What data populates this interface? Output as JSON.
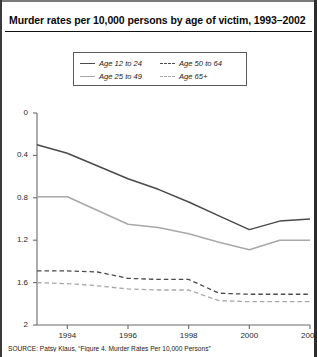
{
  "title": "Murder rates per 10,000 persons by age of victim, 1993–2002",
  "source": "SOURCE: Patsy Klaus, “Figure 4. Murder Rates Per 10,000 Persons”",
  "legend": {
    "position": "top-center",
    "entries": [
      {
        "label": "Age 12 to 24",
        "style": "solid",
        "color": "#4a4a4a"
      },
      {
        "label": "Age 50 to 64",
        "style": "dashed",
        "color": "#4a4a4a"
      },
      {
        "label": "Age 25 to 49",
        "style": "solid",
        "color": "#a8a8a8"
      },
      {
        "label": "Age 65+",
        "style": "dashed",
        "color": "#a8a8a8"
      }
    ]
  },
  "axes": {
    "y_ticks": [
      "2",
      "1.6",
      "1.2",
      "0.8",
      "0.4",
      "0"
    ],
    "x_ticks": [
      "1994",
      "1996",
      "1998",
      "2000",
      "2002"
    ]
  },
  "chart_data": {
    "type": "line",
    "title": "Murder rates per 10,000 persons by age of victim, 1993–2002",
    "xlabel": "",
    "ylabel": "",
    "x": [
      1993,
      1994,
      1995,
      1996,
      1997,
      1998,
      1999,
      2000,
      2001,
      2002
    ],
    "xlim": [
      1993,
      2002
    ],
    "ylim": [
      0,
      2
    ],
    "y_ticks": [
      0,
      0.4,
      0.8,
      1.2,
      1.6,
      2
    ],
    "x_ticks": [
      1994,
      1996,
      1998,
      2000,
      2002
    ],
    "grid": false,
    "legend_position": "top-center",
    "series": [
      {
        "name": "Age 12 to 24",
        "style": "solid",
        "color": "#4a4a4a",
        "values": [
          1.7,
          1.62,
          1.5,
          1.38,
          1.28,
          1.16,
          1.03,
          0.9,
          0.98,
          1.0
        ]
      },
      {
        "name": "Age 25 to 49",
        "style": "solid",
        "color": "#a8a8a8",
        "values": [
          1.21,
          1.21,
          1.08,
          0.95,
          0.92,
          0.86,
          0.78,
          0.71,
          0.8,
          0.8
        ]
      },
      {
        "name": "Age 50 to 64",
        "style": "dashed",
        "color": "#4a4a4a",
        "values": [
          0.51,
          0.51,
          0.5,
          0.44,
          0.43,
          0.43,
          0.3,
          0.29,
          0.29,
          0.29
        ]
      },
      {
        "name": "Age 65+",
        "style": "dashed",
        "color": "#a8a8a8",
        "values": [
          0.4,
          0.39,
          0.37,
          0.34,
          0.33,
          0.33,
          0.23,
          0.22,
          0.22,
          0.22
        ]
      }
    ]
  }
}
